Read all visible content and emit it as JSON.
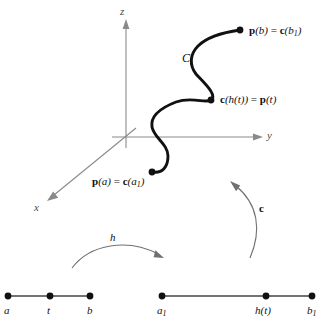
{
  "figure": {
    "kind": "vector-calculus-reparametrization-diagram",
    "colors": {
      "curve": "#111111",
      "axis": "#7d7d7d",
      "segment": "#3c3c3c",
      "dot": "#111111",
      "arrow": "#5a5a5a",
      "background": "#ffffff"
    },
    "axes": {
      "z_label": "z",
      "y_label": "y",
      "x_label": "x",
      "origin": {
        "x": 126,
        "y": 137
      }
    },
    "curve": {
      "name_label": "C",
      "start_point_label": "p(a) = c(a₁)",
      "start_point_parts": {
        "bold1": "p",
        "arg1": "(a)",
        "eq": " = ",
        "bold2": "c",
        "arg2": "(a",
        "sub2": "1",
        "close2": ")"
      },
      "end_point_label": "p(b) = c(b₁)",
      "end_point_parts": {
        "bold1": "p",
        "arg1": "(b)",
        "eq": " = ",
        "bold2": "c",
        "arg2": "(b",
        "sub2": "1",
        "close2": ")"
      },
      "mid_point_label": "c(h(t)) = p(t)",
      "mid_point_parts": {
        "bold1": "c",
        "arg1": "(h(t))",
        "eq": " = ",
        "bold2": "p",
        "arg2": "(t)"
      }
    },
    "mappings": {
      "h_label": "h",
      "c_label": "c"
    },
    "interval_left": {
      "points": [
        {
          "label": "a",
          "x": 8,
          "sub": ""
        },
        {
          "label": "t",
          "x": 50,
          "sub": ""
        },
        {
          "label": "b",
          "x": 90,
          "sub": ""
        }
      ],
      "y": 296
    },
    "interval_right": {
      "points": [
        {
          "label": "a",
          "x": 162,
          "sub": "1"
        },
        {
          "label": "h(t)",
          "x": 266,
          "sub": ""
        },
        {
          "label": "b",
          "x": 312,
          "sub": "1"
        }
      ],
      "y": 296
    }
  }
}
